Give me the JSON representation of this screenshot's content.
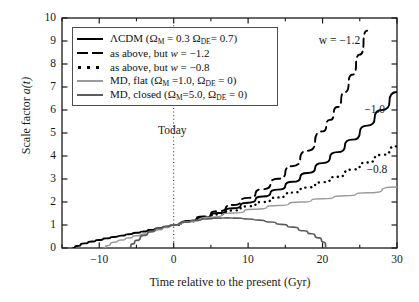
{
  "chart_data": {
    "type": "line",
    "title": "",
    "xlabel": "Time relative to the present (Gyr)",
    "ylabel": "Scale factor a(t)",
    "xlim": [
      -15,
      30
    ],
    "ylim": [
      0,
      10
    ],
    "xticks": [
      -10,
      0,
      10,
      20,
      30
    ],
    "xtick_labels": [
      "−10",
      "0",
      "10",
      "20",
      "30"
    ],
    "xminor_ticks": [
      -15,
      -5,
      5,
      15,
      25
    ],
    "yticks": [
      0,
      1,
      2,
      3,
      4,
      5,
      6,
      7,
      8,
      9,
      10
    ],
    "ytick_labels": [
      "0",
      "1",
      "2",
      "3",
      "4",
      "5",
      "6",
      "7",
      "8",
      "9",
      "10"
    ],
    "grid": false,
    "legend_position": "upper left",
    "annotations": [
      {
        "text": "Today",
        "x": -2.1,
        "y": 5.05,
        "kind": "axis-marker-label"
      },
      {
        "text": "w = −1.2",
        "x": 19.5,
        "y": 8.95,
        "kind": "curve-label"
      },
      {
        "text": "−1.0",
        "x": 25.6,
        "y": 5.95,
        "kind": "curve-label"
      },
      {
        "text": "−0.8",
        "x": 25.9,
        "y": 3.35,
        "kind": "curve-label"
      }
    ],
    "vertical_marker": {
      "x": 0,
      "style": "dotted",
      "label": "Today"
    },
    "series": [
      {
        "name": "ΛCDM (Ω_M = 0.3 Ω_DE = 0.7)",
        "style": "solid",
        "color": "#000000",
        "width": 1.9,
        "x": [
          -13.5,
          -13.0,
          -12.0,
          -11.0,
          -10.0,
          -9.0,
          -8.0,
          -7.0,
          -6.0,
          -5.0,
          -4.0,
          -3.0,
          -2.0,
          -1.0,
          0.0,
          2.0,
          4.0,
          6.0,
          8.0,
          10.0,
          12.0,
          14.0,
          16.0,
          18.0,
          20.0,
          22.0,
          24.0,
          26.0,
          28.0,
          30.0
        ],
        "y": [
          0.0,
          0.09,
          0.2,
          0.28,
          0.35,
          0.42,
          0.48,
          0.54,
          0.6,
          0.66,
          0.72,
          0.79,
          0.86,
          0.93,
          1.0,
          1.16,
          1.33,
          1.52,
          1.73,
          1.97,
          2.24,
          2.54,
          2.88,
          3.26,
          3.69,
          4.17,
          4.71,
          5.32,
          6.0,
          6.78
        ]
      },
      {
        "name": "as above, but w = −1.2",
        "style": "dashed",
        "color": "#000000",
        "width": 1.9,
        "x": [
          0.0,
          2.0,
          4.0,
          6.0,
          8.0,
          10.0,
          12.0,
          14.0,
          16.0,
          18.0,
          20.0,
          21.0,
          22.0,
          23.0,
          24.0,
          25.0,
          26.0
        ],
        "y": [
          1.0,
          1.17,
          1.37,
          1.6,
          1.87,
          2.18,
          2.56,
          3.01,
          3.56,
          4.23,
          5.07,
          5.57,
          6.13,
          6.78,
          7.53,
          8.41,
          9.45
        ]
      },
      {
        "name": "as above, but w = −0.8",
        "style": "dotted",
        "color": "#000000",
        "width": 2.4,
        "x": [
          0.0,
          2.0,
          4.0,
          6.0,
          8.0,
          10.0,
          12.0,
          14.0,
          16.0,
          18.0,
          20.0,
          22.0,
          24.0,
          26.0,
          28.0,
          30.0
        ],
        "y": [
          1.0,
          1.15,
          1.3,
          1.46,
          1.63,
          1.81,
          2.0,
          2.2,
          2.41,
          2.63,
          2.86,
          3.1,
          3.41,
          3.72,
          4.05,
          4.42
        ]
      },
      {
        "name": "MD, flat (Ω_M = 1.0, Ω_DE = 0)",
        "style": "solid",
        "color": "#9a9a9a",
        "width": 1.5,
        "x": [
          -9.3,
          -9.0,
          -8.0,
          -7.0,
          -6.0,
          -5.0,
          -4.0,
          -3.0,
          -2.0,
          -1.0,
          0.0,
          2.0,
          5.0,
          8.0,
          11.0,
          14.0,
          17.0,
          20.0,
          23.0,
          26.0,
          30.0
        ],
        "y": [
          0.0,
          0.1,
          0.25,
          0.35,
          0.44,
          0.53,
          0.61,
          0.7,
          0.79,
          0.89,
          1.0,
          1.14,
          1.34,
          1.52,
          1.69,
          1.85,
          2.0,
          2.14,
          2.27,
          2.4,
          2.65
        ]
      },
      {
        "name": "MD, closed (Ω_M = 5.0, Ω_DE = 0)",
        "style": "solid",
        "color": "#5c5c5c",
        "width": 1.7,
        "x": [
          -6.0,
          -5.5,
          -5.0,
          -4.0,
          -3.0,
          -2.0,
          -1.0,
          0.0,
          1.5,
          3.0,
          4.5,
          6.0,
          7.2,
          8.5,
          10.0,
          11.5,
          13.0,
          14.5,
          16.0,
          17.5,
          18.5,
          19.5,
          20.2,
          20.6
        ],
        "y": [
          0.0,
          0.18,
          0.33,
          0.55,
          0.72,
          0.85,
          0.94,
          1.0,
          1.12,
          1.21,
          1.27,
          1.3,
          1.31,
          1.3,
          1.26,
          1.21,
          1.13,
          1.03,
          0.91,
          0.75,
          0.62,
          0.44,
          0.25,
          0.0
        ]
      }
    ]
  },
  "legend": {
    "entries": [
      {
        "label_prefix": "ΛCDM (Ω",
        "sub1": "M",
        "mid": " = 0.3 Ω",
        "sub2": "DE",
        "suffix": "= 0.7)",
        "sample": "solid-black"
      },
      {
        "label_prefix": "as above, but ",
        "italic": "w",
        "suffix": " = −1.2",
        "sample": "dashed-black"
      },
      {
        "label_prefix": "as above, but ",
        "italic": "w",
        "suffix": " = −0.8",
        "sample": "dotted-black"
      },
      {
        "label_prefix": "MD, flat (Ω",
        "sub1": "M",
        "mid": " =1.0, Ω",
        "sub2": "DE",
        "suffix": " = 0)",
        "sample": "solid-lightgray"
      },
      {
        "label_prefix": "MD, closed (Ω",
        "sub1": "M",
        "mid": "=5.0, Ω",
        "sub2": "DE",
        "suffix": " = 0)",
        "sample": "solid-gray"
      }
    ]
  },
  "axis": {
    "x_title": "Time relative to the present (Gyr)",
    "y_title_prefix": "Scale factor ",
    "y_title_italic": "a(t)"
  },
  "colors": {
    "axis": "#1a1a1a",
    "lcdm": "#000000",
    "md_flat": "#9a9a9a",
    "md_closed": "#5c5c5c",
    "today_line": "#3a3a3a"
  }
}
